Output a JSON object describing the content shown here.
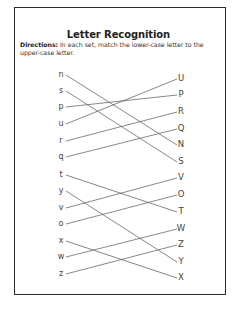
{
  "worksheet": {
    "title": "Letter Recognition",
    "directions_label": "Directions:",
    "directions_text": " In each set, match the lower-case letter to the upper-case letter."
  },
  "lowercase": [
    "n",
    "s",
    "p",
    "u",
    "r",
    "q",
    "t",
    "y",
    "v",
    "o",
    "x",
    "w",
    "z"
  ],
  "uppercase": [
    "U",
    "P",
    "R",
    "Q",
    "N",
    "S",
    "V",
    "O",
    "T",
    "W",
    "Z",
    "Y",
    "X"
  ],
  "matches": [
    {
      "from": "n",
      "to": "N"
    },
    {
      "from": "s",
      "to": "S"
    },
    {
      "from": "p",
      "to": "P"
    },
    {
      "from": "u",
      "to": "U"
    },
    {
      "from": "r",
      "to": "R"
    },
    {
      "from": "q",
      "to": "Q"
    },
    {
      "from": "t",
      "to": "T"
    },
    {
      "from": "y",
      "to": "Y"
    },
    {
      "from": "v",
      "to": "V"
    },
    {
      "from": "o",
      "to": "O"
    },
    {
      "from": "x",
      "to": "X"
    },
    {
      "from": "w",
      "to": "W"
    },
    {
      "from": "z",
      "to": "Z"
    }
  ]
}
